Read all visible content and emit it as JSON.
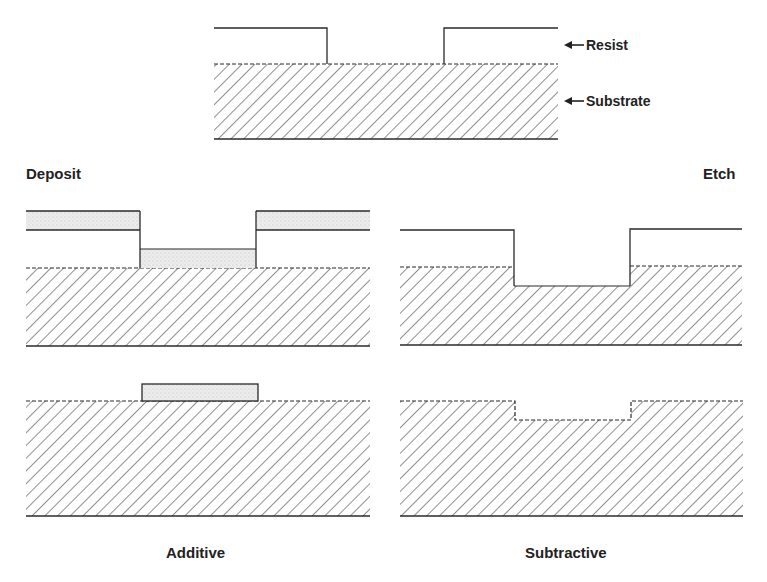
{
  "diagram": {
    "type": "process-flow",
    "topic": "Lithographic pattern transfer: additive vs subtractive",
    "legend": {
      "resist_label": "Resist",
      "substrate_label": "Substrate"
    },
    "branches": {
      "left_heading": "Deposit",
      "right_heading": "Etch",
      "left_result": "Additive",
      "right_result": "Subtractive"
    },
    "colors": {
      "line": "#2a2a2a",
      "hatch": "#333333",
      "deposit_fill": "#e4e4e4",
      "background": "#ffffff"
    }
  }
}
